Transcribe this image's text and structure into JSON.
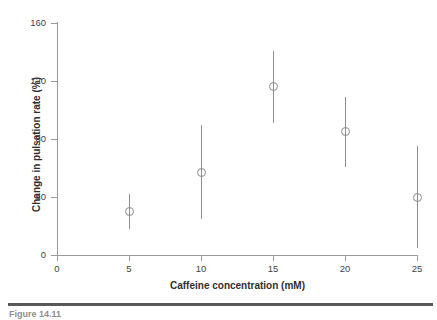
{
  "chart_data": {
    "type": "scatter",
    "title": "",
    "xlabel": "Caffeine concentration (mM)",
    "ylabel": "Change in pulsation rate (%)",
    "xlim": [
      0,
      25
    ],
    "ylim": [
      0,
      160
    ],
    "xticks": [
      "0",
      "5",
      "10",
      "15",
      "20",
      "25"
    ],
    "xtick_values": [
      0,
      5,
      10,
      15,
      20,
      25
    ],
    "yticks": [
      "0",
      "40",
      "80",
      "120",
      "160"
    ],
    "ytick_values": [
      0,
      40,
      80,
      120,
      160
    ],
    "grid": false,
    "legend": "none",
    "marker": "open-circle",
    "error_bars": "vertical",
    "x": [
      5,
      10,
      15,
      20,
      25
    ],
    "values": [
      30,
      57,
      116,
      85,
      40
    ],
    "err_low": [
      18,
      25,
      91,
      61,
      5
    ],
    "err_high": [
      42,
      90,
      141,
      109,
      75
    ],
    "points": [
      {
        "x": 5,
        "y": 30,
        "low": 18,
        "high": 42
      },
      {
        "x": 10,
        "y": 57,
        "low": 25,
        "high": 90
      },
      {
        "x": 15,
        "y": 116,
        "low": 91,
        "high": 141
      },
      {
        "x": 20,
        "y": 85,
        "low": 61,
        "high": 109
      },
      {
        "x": 25,
        "y": 40,
        "low": 5,
        "high": 75
      }
    ]
  },
  "caption": {
    "text": "Figure 14.11"
  },
  "colors": {
    "axis": "#9a9a9a",
    "series": "#8d8d8d",
    "text": "#3f3f3f",
    "rule": "#595959"
  }
}
